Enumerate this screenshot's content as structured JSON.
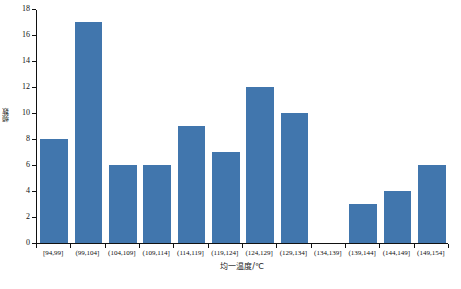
{
  "chart_data": {
    "type": "bar",
    "title": "",
    "xlabel": "均一温度/℃",
    "ylabel": "频数",
    "categories": [
      "[94,99]",
      "(99,104]",
      "(104,109]",
      "(109,114]",
      "(114,119]",
      "(119,124]",
      "(124,129]",
      "(129,134]",
      "(134,139]",
      "(139,144]",
      "(144,149]",
      "(149,154]"
    ],
    "values": [
      8,
      17,
      6,
      6,
      9,
      7,
      12,
      10,
      0,
      3,
      4,
      6
    ],
    "ylim": [
      0,
      18
    ],
    "yticks": [
      0,
      2,
      4,
      6,
      8,
      10,
      12,
      14,
      16,
      18
    ],
    "ytick_labels": [
      "0",
      "2",
      "4",
      "6",
      "8",
      "10",
      "12",
      "14",
      "16",
      "18"
    ],
    "grid": false,
    "legend": false,
    "bar_color": "#4176ad",
    "axis_color": "#111111",
    "background": "#ffffff"
  },
  "figure": {
    "caption": ""
  }
}
